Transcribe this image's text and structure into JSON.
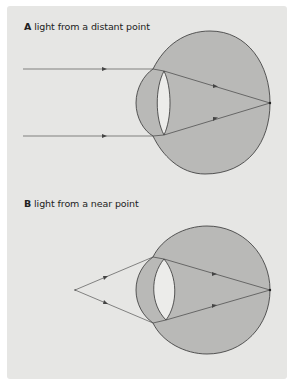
{
  "figure": {
    "panels": [
      {
        "letter": "A",
        "caption": "light from a distant point"
      },
      {
        "letter": "B",
        "caption": "light from a near point"
      }
    ],
    "colors": {
      "background": "#e6e6e4",
      "eye_fill": "#b9b9b7",
      "lens_fill": "#ececea",
      "stroke": "#333333",
      "ray": "#444444"
    }
  }
}
